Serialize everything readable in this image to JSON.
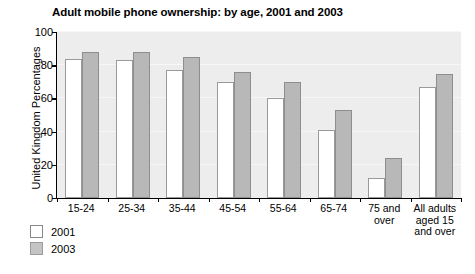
{
  "chart_data": {
    "type": "bar",
    "title": "Adult mobile phone ownership: by age, 2001 and 2003",
    "xlabel": "",
    "ylabel": "United Kingdom Percentages",
    "ylim": [
      0,
      100
    ],
    "yticks": [
      0,
      20,
      40,
      60,
      80,
      100
    ],
    "grid": true,
    "legend_position": "below-left",
    "categories": [
      "15-24",
      "25-34",
      "35-44",
      "45-54",
      "55-64",
      "65-74",
      "75 and over",
      "All adults aged 15 and over"
    ],
    "series": [
      {
        "name": "2001",
        "color": "#ffffff",
        "values": [
          84,
          83,
          77,
          70,
          60,
          41,
          12,
          67
        ]
      },
      {
        "name": "2003",
        "color": "#b8b8b8",
        "values": [
          88,
          88,
          85,
          76,
          70,
          53,
          24,
          75
        ]
      }
    ]
  },
  "axis": {
    "y_tick_labels": [
      "0",
      "20",
      "40",
      "60",
      "80",
      "100"
    ],
    "x_tick_labels": [
      [
        "15-24"
      ],
      [
        "25-34"
      ],
      [
        "35-44"
      ],
      [
        "45-54"
      ],
      [
        "55-64"
      ],
      [
        "65-74"
      ],
      [
        "75 and",
        "over"
      ],
      [
        "All adults",
        "aged 15",
        "and over"
      ]
    ]
  },
  "legend": {
    "items": [
      {
        "label": "2001",
        "swatch": "white-swatch"
      },
      {
        "label": "2003",
        "swatch": "gray-swatch"
      }
    ]
  },
  "colors": {
    "plot_background": "#ededed",
    "series_2001": "#ffffff",
    "series_2003": "#b8b8b8",
    "axis": "#000000",
    "gridline": "#f7f7f7"
  }
}
